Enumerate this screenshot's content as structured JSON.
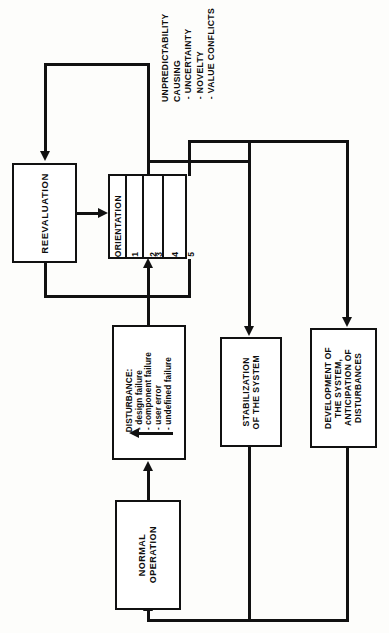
{
  "diagram": {
    "orientation": "rotated-90-ccw",
    "ink_color": "#111111",
    "paper_color": "#fdfdfb",
    "nodes": {
      "reevaluation": {
        "label": "REEVALUATION"
      },
      "orientation": {
        "title": "ORIENTATION",
        "cells": [
          "1",
          "2",
          "3",
          "4",
          "5"
        ]
      },
      "disturbance": {
        "label": "DISTURBANCE:\n - design failure\n - component failure\n - user error\n - undefined failure"
      },
      "stabilization": {
        "label": "STABILIZATION\nOF THE SYSTEM"
      },
      "development": {
        "label": "DEVELOPMENT OF\nTHE SYSTEM,\nANTICIPATION OF\nDISTURBANCES"
      },
      "normal_operation": {
        "label": "NORMAL\nOPERATION"
      }
    },
    "annotations": {
      "unpredictability": "UNPREDICTABILITY\nCAUSING\n - UNCERTAINTY\n - NOVELTY\n - VALUE CONFLICTS"
    }
  }
}
